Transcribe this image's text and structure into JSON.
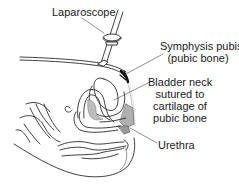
{
  "diagram": {
    "labels": {
      "laparoscope": "Laparoscope",
      "symphysis_line1": "Symphysis pubis",
      "symphysis_line2": "(pubic bone)",
      "bladder_line1": "Bladder neck",
      "bladder_line2": "sutured to",
      "bladder_line3": "cartilage of",
      "bladder_line4": "pubic bone",
      "urethra": "Urethra"
    },
    "colors": {
      "line": "#2a2a2a",
      "shade": "#b8b8b8",
      "background": "#ffffff"
    }
  }
}
